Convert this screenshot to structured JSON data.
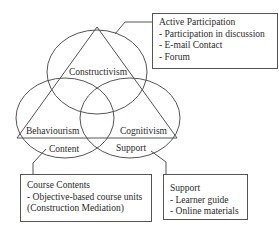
{
  "diagram": {
    "circles": {
      "top": "Constructivism",
      "left": "Behaviourism",
      "right": "Cognitivism"
    },
    "region_labels": {
      "left_bottom": "Content",
      "right_bottom": "Support"
    },
    "boxes": {
      "active_participation": {
        "title": "Active Participation",
        "items": [
          "-  Participation in discussion",
          "-  E-mail  Contact",
          "-  Forum"
        ]
      },
      "course_contents": {
        "title": "Course Contents",
        "items": [
          "- Objective-based course units",
          "(Construction Mediation)"
        ]
      },
      "support": {
        "title": "Support",
        "items": [
          "-  Learner  guide",
          "- Online materials"
        ]
      }
    },
    "colors": {
      "line": "#555555",
      "text": "#2a2a2a"
    }
  }
}
